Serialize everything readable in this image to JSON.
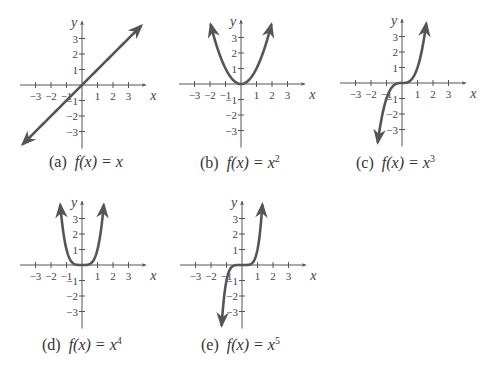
{
  "chart_data": [
    {
      "type": "line",
      "label": "(a)",
      "title": "f(x) = x",
      "function": "x",
      "exponent": 1,
      "xlabel": "x",
      "ylabel": "y",
      "xticks": [
        -3,
        -2,
        -1,
        1,
        2,
        3
      ],
      "yticks": [
        -3,
        -2,
        -1,
        1,
        2,
        3
      ],
      "xlim": [
        -4,
        4
      ],
      "ylim": [
        -4,
        4
      ],
      "grid": false,
      "x": [
        -3.8,
        -3,
        -2,
        -1,
        0,
        1,
        2,
        3,
        3.8
      ],
      "y": [
        -3.8,
        -3,
        -2,
        -1,
        0,
        1,
        2,
        3,
        3.8
      ]
    },
    {
      "type": "line",
      "label": "(b)",
      "title": "f(x) = x^2",
      "function": "x^2",
      "exponent": 2,
      "xlabel": "x",
      "ylabel": "y",
      "xticks": [
        -3,
        -2,
        -1,
        1,
        2,
        3
      ],
      "yticks": [
        -3,
        -2,
        -1,
        1,
        2,
        3
      ],
      "xlim": [
        -4,
        4
      ],
      "ylim": [
        -4,
        4
      ],
      "grid": false,
      "x": [
        -1.95,
        -1.5,
        -1,
        -0.5,
        0,
        0.5,
        1,
        1.5,
        1.95
      ],
      "y": [
        3.8,
        2.25,
        1,
        0.25,
        0,
        0.25,
        1,
        2.25,
        3.8
      ]
    },
    {
      "type": "line",
      "label": "(c)",
      "title": "f(x) = x^3",
      "function": "x^3",
      "exponent": 3,
      "xlabel": "x",
      "ylabel": "y",
      "xticks": [
        -3,
        -2,
        -1,
        1,
        2,
        3
      ],
      "yticks": [
        -3,
        -2,
        -1,
        1,
        2,
        3
      ],
      "xlim": [
        -4,
        4
      ],
      "ylim": [
        -4,
        4
      ],
      "grid": false,
      "x": [
        -1.56,
        -1.25,
        -1,
        -0.5,
        0,
        0.5,
        1,
        1.25,
        1.56
      ],
      "y": [
        -3.8,
        -1.95,
        -1,
        -0.125,
        0,
        0.125,
        1,
        1.95,
        3.8
      ]
    },
    {
      "type": "line",
      "label": "(d)",
      "title": "f(x) = x^4",
      "function": "x^4",
      "exponent": 4,
      "xlabel": "x",
      "ylabel": "y",
      "xticks": [
        -3,
        -2,
        -1,
        1,
        2,
        3
      ],
      "yticks": [
        -3,
        -2,
        -1,
        1,
        2,
        3
      ],
      "xlim": [
        -4,
        4
      ],
      "ylim": [
        -4,
        4
      ],
      "grid": false,
      "x": [
        -1.4,
        -1.2,
        -1,
        -0.5,
        0,
        0.5,
        1,
        1.2,
        1.4
      ],
      "y": [
        3.8,
        2.07,
        1,
        0.06,
        0,
        0.06,
        1,
        2.07,
        3.8
      ]
    },
    {
      "type": "line",
      "label": "(e)",
      "title": "f(x) = x^5",
      "function": "x^5",
      "exponent": 5,
      "xlabel": "x",
      "ylabel": "y",
      "xticks": [
        -3,
        -2,
        -1,
        1,
        2,
        3
      ],
      "yticks": [
        -3,
        -2,
        -1,
        1,
        2,
        3
      ],
      "xlim": [
        -4,
        4
      ],
      "ylim": [
        -4,
        4
      ],
      "grid": false,
      "x": [
        -1.31,
        -1.15,
        -1,
        -0.5,
        0,
        0.5,
        1,
        1.15,
        1.31
      ],
      "y": [
        -3.8,
        -2.01,
        -1,
        -0.03,
        0,
        0.03,
        1,
        2.01,
        3.8
      ]
    }
  ],
  "captions": [
    {
      "label": "(a)",
      "fx": "f(x) = x",
      "exp": ""
    },
    {
      "label": "(b)",
      "fx": "f(x) = x",
      "exp": "2"
    },
    {
      "label": "(c)",
      "fx": "f(x) = x",
      "exp": "3"
    },
    {
      "label": "(d)",
      "fx": "f(x) = x",
      "exp": "4"
    },
    {
      "label": "(e)",
      "fx": "f(x) = x",
      "exp": "5"
    }
  ],
  "colors": {
    "curve": "#555555",
    "axis": "#555555",
    "text": "#333333"
  }
}
